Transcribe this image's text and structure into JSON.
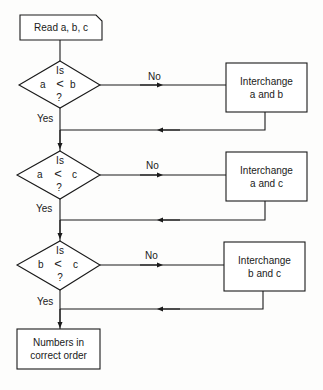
{
  "diagram": {
    "type": "flowchart",
    "start": {
      "label": "Read a, b, c"
    },
    "decisions": [
      {
        "line1": "Is",
        "left": "a",
        "op": "<",
        "right": "b",
        "line3": "?",
        "yes_label": "Yes",
        "no_label": "No"
      },
      {
        "line1": "Is",
        "left": "a",
        "op": "<",
        "right": "c",
        "line3": "?",
        "yes_label": "Yes",
        "no_label": "No"
      },
      {
        "line1": "Is",
        "left": "b",
        "op": "<",
        "right": "c",
        "line3": "?",
        "yes_label": "Yes",
        "no_label": "No"
      }
    ],
    "processes": [
      {
        "line1": "Interchange",
        "line2": "a and b"
      },
      {
        "line1": "Interchange",
        "line2": "a and c"
      },
      {
        "line1": "Interchange",
        "line2": "b and c"
      }
    ],
    "end": {
      "line1": "Numbers in",
      "line2": "correct order"
    },
    "colors": {
      "stroke": "#1a1a1a",
      "background": "#fdfdfc"
    }
  }
}
